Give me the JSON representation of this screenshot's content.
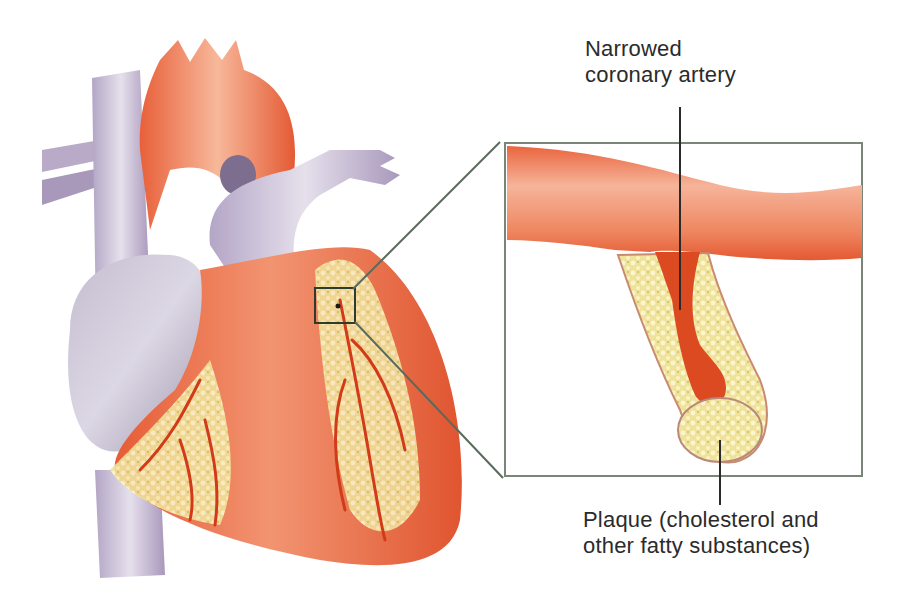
{
  "diagram": {
    "labels": {
      "narrowed_artery": {
        "line1": "Narrowed",
        "line2": "coronary artery"
      },
      "plaque": {
        "line1": "Plaque (cholesterol and",
        "line2": "other fatty substances)"
      }
    },
    "colors": {
      "muscle": "#e8603a",
      "muscle_light": "#f4a07c",
      "vessel_blue": "#b7a9c8",
      "vessel_gray": "#c9c3d4",
      "fat": "#f3e7a0",
      "plaque": "#efe4a2",
      "artery_wall": "#e25a33",
      "lumen": "#d8431f",
      "callout_line": "#5b6a5b",
      "text": "#2b2b2b"
    }
  }
}
